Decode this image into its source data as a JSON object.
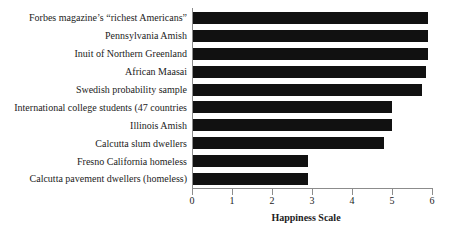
{
  "chart_data": {
    "type": "bar",
    "orientation": "horizontal",
    "title": "",
    "xlabel": "Happiness Scale",
    "ylabel": "",
    "xlim": [
      0,
      6
    ],
    "xticks": [
      0,
      1,
      2,
      3,
      4,
      5,
      6
    ],
    "xtick_labels": [
      "0",
      "1",
      "2",
      "3",
      "4",
      "5",
      "6"
    ],
    "grid": false,
    "legend": false,
    "categories": [
      "Forbes magazine’s “richest Americans”",
      "Pennsylvania Amish",
      "Inuit of Northern Greenland",
      "African Maasai",
      "Swedish probability sample",
      "International college students (47 countries",
      "Illinois Amish",
      "Calcutta slum dwellers",
      "Fresno California homeless",
      "Calcutta pavement dwellers (homeless)"
    ],
    "values": [
      5.9,
      5.9,
      5.9,
      5.85,
      5.75,
      5.0,
      5.0,
      4.8,
      2.9,
      2.9
    ],
    "bar_color": "#111111",
    "axis_color": "#8c8c8c",
    "text_color": "#1c1c1c",
    "background": "#ffffff"
  }
}
